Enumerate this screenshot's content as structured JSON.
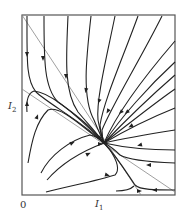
{
  "diagram": {
    "type": "phase-portrait",
    "labels": {
      "origin": "0",
      "x_axis": "I",
      "x_axis_sub": "1",
      "y_axis": "I",
      "y_axis_sub": "2"
    },
    "colors": {
      "frame": "#555555",
      "nullcline": "#888888",
      "trajectory": "#222222",
      "arrow": "#222222"
    },
    "frame": {
      "x": 22,
      "y": 15,
      "width": 153,
      "height": 180
    },
    "nullclines": [
      {
        "name": "nullcline-1",
        "from": [
          22,
          15
        ],
        "to": [
          141,
          195
        ]
      },
      {
        "name": "nullcline-2",
        "from": [
          22,
          89
        ],
        "to": [
          175,
          192
        ]
      }
    ],
    "fixed_point": [
      104,
      143
    ],
    "trajectories": [
      "M27 16 C27 60 26 80 36 92 C50 105 80 120 104 143",
      "M44 16 C44 60 44 88 58 102 C72 112 90 125 104 143",
      "M68 16 C66 60 64 92 78 112 C88 124 96 132 104 143",
      "M91 16 C86 60 82 98 94 120 C98 130 101 136 104 143",
      "M115 16 C106 60 96 100 98 120 C100 132 102 137 104 143",
      "M138 16 C122 60 104 100 100 125 C101 135 102 139 104 143",
      "M162 16 C140 60 112 105 102 130 C102 137 103 140 104 143",
      "M175 41 C150 70 118 110 104 143",
      "M175 62 C150 85 120 118 104 143",
      "M175 75 C152 95 124 122 104 143",
      "M175 89 C152 105 126 126 104 143",
      "M175 108 C150 118 126 130 104 143",
      "M175 130 C150 134 126 138 104 143",
      "M175 150 C150 150 126 148 104 143",
      "M175 163 C150 162 128 160 120 155 C115 150 110 146 104 143",
      "M175 190 C155 190 140 190 135 185 C128 175 118 158 104 143",
      "M116 191 C124 191 130 190 134 186",
      "M46 192 C70 186 100 180 115 175 C120 170 118 162 110 150 L104 143",
      "M47 180 C60 165 80 152 104 143",
      "M41 173 C50 155 70 140 90 135 C96 136 100 139 104 143",
      "M28 163 C32 140 36 122 48 110 C60 105 80 125 104 143",
      "M27 112 C26 100 28 93 34 91 C48 92 72 110 104 143"
    ],
    "arrows": [
      [
        27,
        54,
        90
      ],
      [
        43,
        58,
        90
      ],
      [
        66,
        76,
        90
      ],
      [
        86,
        90,
        100
      ],
      [
        99,
        101,
        110
      ],
      [
        108,
        111,
        120
      ],
      [
        121,
        112,
        135
      ],
      [
        127,
        112,
        140
      ],
      [
        131,
        126,
        150
      ],
      [
        140,
        145,
        165
      ],
      [
        149,
        165,
        180
      ],
      [
        155,
        190,
        180
      ],
      [
        139,
        191,
        0
      ],
      [
        107,
        175,
        15
      ],
      [
        72,
        143,
        -25
      ],
      [
        88,
        154,
        -25
      ],
      [
        37,
        117,
        -70
      ],
      [
        27,
        104,
        -90
      ],
      [
        100,
        138,
        45
      ],
      [
        100,
        144,
        0
      ]
    ]
  }
}
